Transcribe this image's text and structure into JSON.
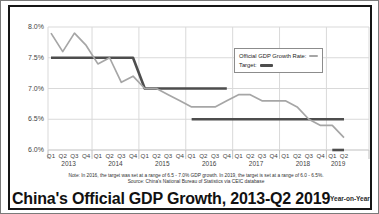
{
  "title": "China's Official GDP Growth, 2013-Q2 2019",
  "subtitle_right": "Year-on-Year",
  "note": "Note: In 2016, the target was set at a range of 6.5 - 7.0% GDP growth. In 2019, the target is set at a range of 6.0 - 6.5%.",
  "source": "Source: China's National Bureau of Statistics via CEIC database",
  "legend": {
    "items": [
      {
        "label": "Official GDP Growth Rate:",
        "color": "#a6a6a6"
      },
      {
        "label": "Target:",
        "color": "#4d4d4d"
      }
    ]
  },
  "colors": {
    "gdp_line": "#a6a6a6",
    "target_line": "#4d4d4d",
    "grid": "#d9d9d9",
    "axis": "#bfbfbf",
    "frame": "#161616"
  },
  "chart_data": {
    "type": "line",
    "title": "China's Official GDP Growth, 2013-Q2 2019",
    "xlabel": "",
    "ylabel": "GDP growth, year-on-year (%)",
    "ylim": [
      6.0,
      8.0
    ],
    "grid": true,
    "legend_position": "upper-right-inside",
    "yticks": [
      {
        "label": "8.0%",
        "value": 8.0
      },
      {
        "label": "7.5%",
        "value": 7.5
      },
      {
        "label": "7.0%",
        "value": 7.0
      },
      {
        "label": "6.5%",
        "value": 6.5
      },
      {
        "label": "6.0%",
        "value": 6.0
      }
    ],
    "years": [
      {
        "label": "2013",
        "quarters": [
          "Q1",
          "Q2",
          "Q3",
          "Q4"
        ]
      },
      {
        "label": "2014",
        "quarters": [
          "Q1",
          "Q2",
          "Q3",
          "Q4"
        ]
      },
      {
        "label": "2015",
        "quarters": [
          "Q1",
          "Q2",
          "Q3",
          "Q4"
        ]
      },
      {
        "label": "2016",
        "quarters": [
          "Q1",
          "Q2",
          "Q3",
          "Q4"
        ]
      },
      {
        "label": "2017",
        "quarters": [
          "Q1",
          "Q2",
          "Q3",
          "Q4"
        ]
      },
      {
        "label": "2018",
        "quarters": [
          "Q1",
          "Q2",
          "Q3",
          "Q4"
        ]
      },
      {
        "label": "2019",
        "quarters": [
          "Q1",
          "Q2"
        ]
      }
    ],
    "categories": [
      "2013 Q1",
      "2013 Q2",
      "2013 Q3",
      "2013 Q4",
      "2014 Q1",
      "2014 Q2",
      "2014 Q3",
      "2014 Q4",
      "2015 Q1",
      "2015 Q2",
      "2015 Q3",
      "2015 Q4",
      "2016 Q1",
      "2016 Q2",
      "2016 Q3",
      "2016 Q4",
      "2017 Q1",
      "2017 Q2",
      "2017 Q3",
      "2017 Q4",
      "2018 Q1",
      "2018 Q2",
      "2018 Q3",
      "2018 Q4",
      "2019 Q1",
      "2019 Q2"
    ],
    "series": [
      {
        "name": "Official GDP Growth Rate",
        "color": "#a6a6a6",
        "values": [
          7.9,
          7.6,
          7.9,
          7.7,
          7.4,
          7.5,
          7.1,
          7.2,
          7.0,
          7.0,
          6.9,
          6.8,
          6.7,
          6.7,
          6.7,
          6.8,
          6.9,
          6.9,
          6.8,
          6.8,
          6.8,
          6.7,
          6.5,
          6.4,
          6.4,
          6.2
        ]
      }
    ],
    "target": {
      "name": "Target",
      "color": "#4d4d4d",
      "description": "Official annual GDP growth target: 7.5% (2013-2014), 7.0% (2015), 6.5-7.0% range (2016), 6.5% (2017-2018), 6.0-6.5% range (2019)",
      "segments": [
        {
          "name": "target-7.5-to-7.0",
          "points": [
            [
              0,
              7.5
            ],
            [
              7,
              7.5
            ],
            [
              8,
              7.0
            ],
            [
              15,
              7.0
            ]
          ]
        },
        {
          "name": "target-6.5",
          "points": [
            [
              12,
              6.5
            ],
            [
              25,
              6.5
            ]
          ]
        },
        {
          "name": "target-6.0-2019",
          "points": [
            [
              24,
              6.0
            ],
            [
              25,
              6.0
            ]
          ]
        }
      ]
    }
  }
}
